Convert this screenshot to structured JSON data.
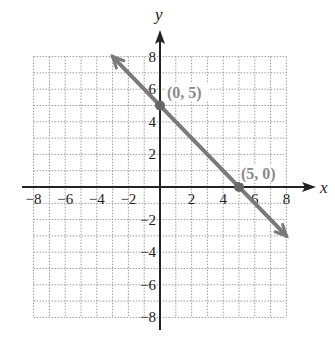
{
  "chart_data": {
    "type": "line",
    "title": "",
    "xlabel": "x",
    "ylabel": "y",
    "xlim": [
      -8,
      8
    ],
    "ylim": [
      -8,
      8
    ],
    "grid": true,
    "x_ticks": [
      "−8",
      "−6",
      "−4",
      "−2",
      "2",
      "4",
      "6",
      "8"
    ],
    "y_ticks": [
      "8",
      "6",
      "4",
      "2",
      "−2",
      "−4",
      "−6",
      "−8"
    ],
    "series": [
      {
        "name": "y = −x + 5",
        "x": [
          -3,
          8
        ],
        "y": [
          8,
          -3
        ],
        "color": "#7a7a7a",
        "arrows": "both"
      }
    ],
    "points": [
      {
        "x": 0,
        "y": 5,
        "label": "(0, 5)"
      },
      {
        "x": 5,
        "y": 0,
        "label": "(5, 0)"
      }
    ]
  }
}
